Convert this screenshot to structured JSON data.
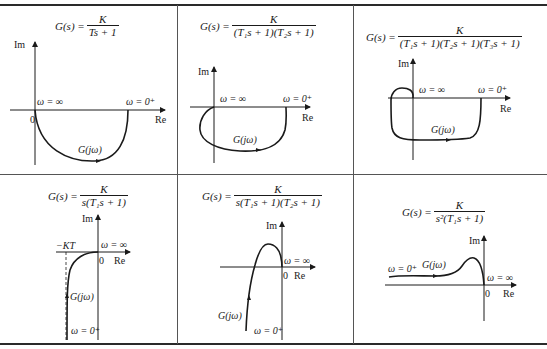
{
  "table": {
    "cells": [
      {
        "formula": {
          "lhs": "G(s) =",
          "numerator": "K",
          "denominator": "Ts + 1"
        },
        "axes": {
          "im_label": "Im",
          "re_label": "Re",
          "origin_label": "0"
        },
        "annotations": {
          "omega_inf": "ω = ∞",
          "omega_zero": "ω = 0⁺",
          "curve": "G(jω)"
        }
      },
      {
        "formula": {
          "lhs": "G(s) =",
          "numerator": "K",
          "denominator": "(T₁s + 1)(T₂s + 1)"
        },
        "axes": {
          "im_label": "Im",
          "re_label": "Re"
        },
        "annotations": {
          "omega_inf": "ω = ∞",
          "omega_zero": "ω = 0⁺",
          "curve": "G(jω)"
        }
      },
      {
        "formula": {
          "lhs": "G(s) =",
          "numerator": "K",
          "denominator": "(T₁s + 1)(T₂s + 1)(T₃s + 1)"
        },
        "axes": {
          "im_label": "Im",
          "re_label": "Re"
        },
        "annotations": {
          "omega_inf": "ω = ∞",
          "omega_zero": "ω = 0⁺",
          "curve": "G(jω)"
        }
      },
      {
        "formula": {
          "lhs": "G(s) =",
          "numerator": "K",
          "denominator": "s(T₁s + 1)"
        },
        "axes": {
          "im_label": "Im",
          "re_label": "Re",
          "origin_label": "0"
        },
        "annotations": {
          "asymptote": "−KT",
          "omega_inf": "ω = ∞",
          "omega_zero": "ω = 0⁺",
          "curve": "G(jω)"
        }
      },
      {
        "formula": {
          "lhs": "G(s) =",
          "numerator": "K",
          "denominator": "s(T₁s + 1)(T₂s + 1)"
        },
        "axes": {
          "im_label": "Im",
          "re_label": "Re",
          "origin_label": "0"
        },
        "annotations": {
          "omega_inf": "ω = ∞",
          "omega_zero": "ω = 0⁺",
          "curve": "G(jω)"
        }
      },
      {
        "formula": {
          "lhs": "G(s) =",
          "numerator": "K",
          "denominator": "s²(T₁s + 1)"
        },
        "axes": {
          "im_label": "Im",
          "re_label": "Re",
          "origin_label": "0"
        },
        "annotations": {
          "omega_inf": "ω = ∞",
          "omega_zero": "ω = 0⁺",
          "curve": "G(jω)"
        }
      }
    ]
  },
  "colors": {
    "ink": "#1a1a1a",
    "rule": "#2a2a2a",
    "grid": "#555555",
    "background": "#ffffff"
  }
}
